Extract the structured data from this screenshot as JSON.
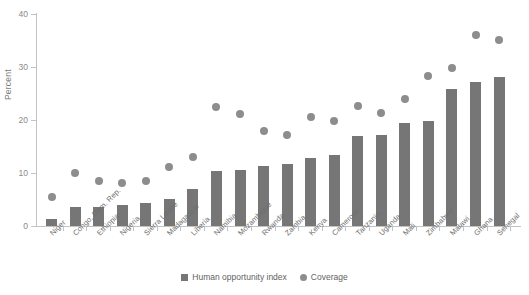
{
  "chart_data": {
    "type": "bar",
    "title": "",
    "subtitle": "",
    "xlabel": "",
    "ylabel": "Percent",
    "ylim": [
      0,
      40
    ],
    "yticks": [
      0,
      10,
      20,
      30,
      40
    ],
    "grid": false,
    "legend_position": "bottom-center",
    "categories": [
      "Niger",
      "Congo, Dem. Rep.",
      "Ethiopia",
      "Nigeria",
      "Sierra Leone",
      "Madagascar",
      "Liberia",
      "Namibia",
      "Mozambique",
      "Rwanda",
      "Zambia",
      "Kenya",
      "Cameroon",
      "Tanzania",
      "Uganda",
      "Mali",
      "Zimbabwe",
      "Malawi",
      "Ghana",
      "Senegal"
    ],
    "series": [
      {
        "name": "Human opportunity index",
        "marker": "square",
        "color": "#767676",
        "values": [
          1.3,
          3.5,
          3.6,
          3.9,
          4.4,
          5.1,
          6.9,
          10.4,
          10.5,
          11.3,
          11.7,
          12.9,
          13.4,
          16.9,
          17.2,
          19.5,
          19.9,
          25.8,
          27.2,
          28.1
        ]
      },
      {
        "name": "Coverage",
        "marker": "circle",
        "color": "#8d8d8d",
        "values": [
          5.4,
          10.0,
          8.4,
          8.1,
          8.4,
          11.1,
          13.0,
          22.4,
          21.2,
          18.0,
          17.2,
          20.6,
          19.9,
          22.7,
          21.3,
          24.0,
          28.3,
          29.9,
          36.0,
          35.1
        ]
      }
    ]
  },
  "legend": {
    "entries": [
      {
        "label": "Human opportunity index"
      },
      {
        "label": "Coverage"
      }
    ]
  }
}
